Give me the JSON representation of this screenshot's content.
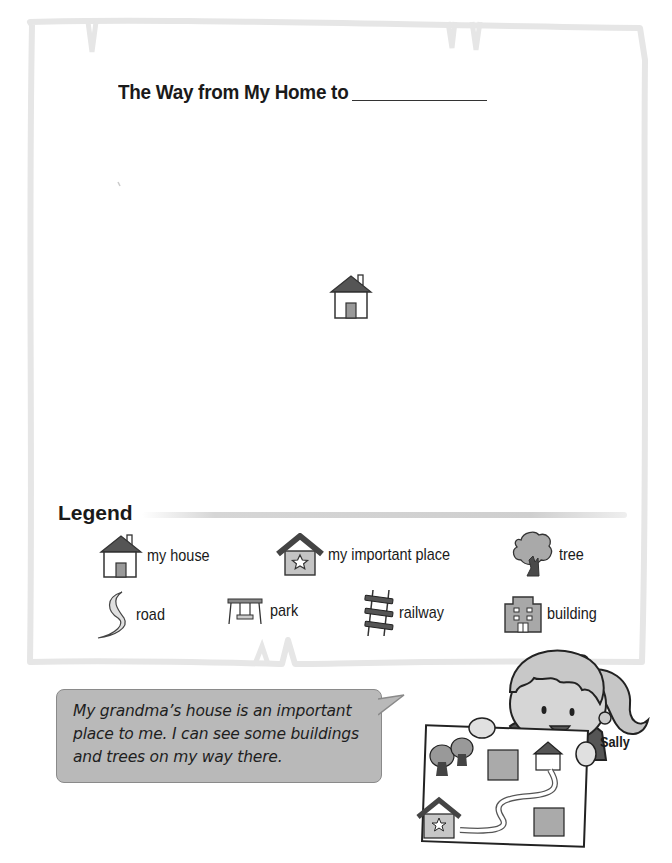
{
  "worksheet": {
    "title": "The Way from My Home to",
    "title_blank": "",
    "map_start_icon": "house-icon"
  },
  "legend": {
    "heading": "Legend",
    "items": [
      {
        "label": "my house",
        "icon": "house-icon"
      },
      {
        "label": "my important place",
        "icon": "important-place-icon"
      },
      {
        "label": "tree",
        "icon": "tree-icon"
      },
      {
        "label": "road",
        "icon": "road-icon"
      },
      {
        "label": "park",
        "icon": "park-swing-icon"
      },
      {
        "label": "railway",
        "icon": "railway-icon"
      },
      {
        "label": "building",
        "icon": "building-icon"
      }
    ]
  },
  "speech_bubble": {
    "lines": [
      "My grandma’s house is an important",
      "place to me.  I can see some buildings",
      "and trees on my way there."
    ]
  },
  "character": {
    "name": "Sally"
  },
  "colors": {
    "frame": "#e8e8e8",
    "roof": "#555555",
    "fill_gray": "#a8a8a8",
    "bubble": "#b9b9b9"
  }
}
